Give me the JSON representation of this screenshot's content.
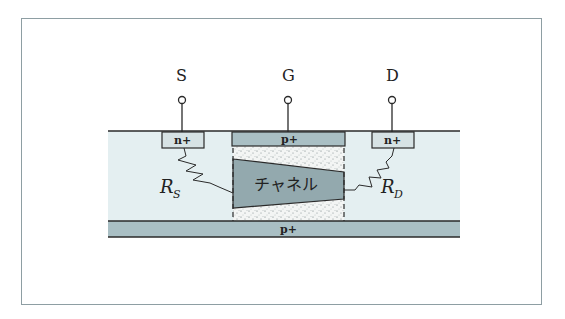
{
  "diagram": {
    "terminals": [
      {
        "id": "source",
        "label": "S"
      },
      {
        "id": "gate",
        "label": "G"
      },
      {
        "id": "drain",
        "label": "D"
      }
    ],
    "regions": {
      "source_region": "n+",
      "gate_top": "p+",
      "drain_region": "n+",
      "gate_bottom": "p+",
      "channel": "チャネル"
    },
    "resistors": {
      "source": {
        "symbol": "R",
        "subscript": "S"
      },
      "drain": {
        "symbol": "R",
        "subscript": "D"
      }
    },
    "colors": {
      "substrate": "#e4eff1",
      "p_plus": "#a9bfc4",
      "n_plus": "#d6e2e4",
      "channel": "#93a9ae",
      "depletion": "#f2f4f3",
      "line": "#2a2a2a",
      "frame": "#8e9ea3"
    }
  }
}
